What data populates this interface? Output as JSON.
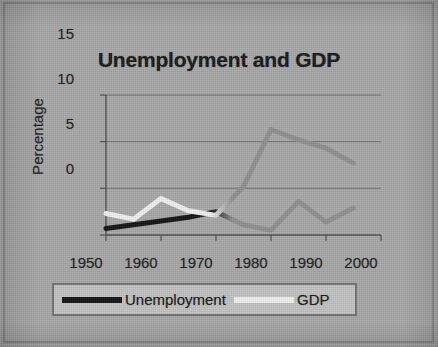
{
  "chart_data": {
    "type": "line",
    "title": "Unemployment and GDP",
    "xlabel": "",
    "ylabel": "Percentage",
    "xlim": [
      1950,
      2000
    ],
    "ylim": [
      0,
      15
    ],
    "xticks": [
      "1950",
      "1960",
      "1970",
      "1980",
      "1990",
      "2000"
    ],
    "yticks": [
      "0",
      "5",
      "10",
      "15"
    ],
    "grid": true,
    "legend_position": "bottom",
    "x": [
      1950,
      1955,
      1960,
      1965,
      1970,
      1975,
      1980,
      1985,
      1990,
      1995
    ],
    "series": [
      {
        "name": "Unemployment",
        "color": "#101010",
        "values": [
          0.7,
          1.1,
          1.5,
          1.9,
          2.5,
          1.1,
          0.5,
          3.6,
          1.4,
          2.9
        ]
      },
      {
        "name": "GDP",
        "color": "#f2f2f2",
        "values": [
          2.3,
          1.7,
          3.9,
          2.6,
          2.1,
          5.2,
          11.3,
          10.2,
          9.3,
          7.7
        ]
      }
    ]
  },
  "legend": {
    "items": [
      {
        "label": "Unemployment",
        "color": "#101010"
      },
      {
        "label": "GDP",
        "color": "#f2f2f2"
      }
    ]
  },
  "colors": {
    "page_background": "#a8a8a8",
    "frame": "#8a8a8a",
    "axis": "#4a4a4a",
    "grid": "#6f6f6f",
    "text": "#141414",
    "legend_background": "#c2c2c2",
    "legend_border": "#707070",
    "faded_line": "#8f8f8f"
  }
}
